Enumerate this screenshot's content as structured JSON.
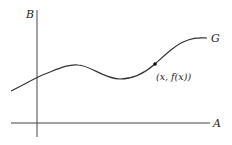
{
  "diagram": {
    "type": "function-graph",
    "axes": {
      "horizontal_label": "A",
      "vertical_label": "B"
    },
    "curve": {
      "label": "G",
      "color": "#333333"
    },
    "point": {
      "label": "(x, f(x))",
      "color": "#111111"
    }
  }
}
